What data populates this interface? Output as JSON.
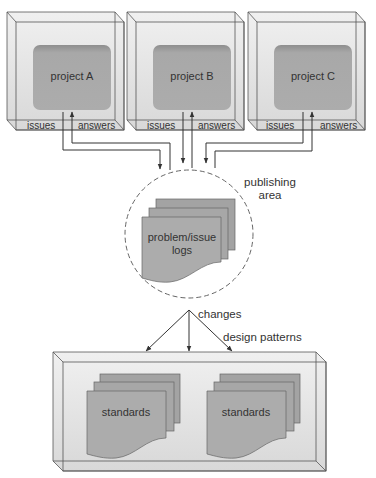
{
  "projects": [
    {
      "label": "project A",
      "issues_label": "issues",
      "answers_label": "answers"
    },
    {
      "label": "project B",
      "issues_label": "issues",
      "answers_label": "answers"
    },
    {
      "label": "project C",
      "issues_label": "issues",
      "answers_label": "answers"
    }
  ],
  "publishing": {
    "area_label_line1": "publishing",
    "area_label_line2": "area",
    "logs_label_line1": "problem/issue",
    "logs_label_line2": "logs"
  },
  "flows": {
    "changes_label": "changes",
    "design_patterns_label": "design patterns"
  },
  "standards": [
    {
      "label": "standards"
    },
    {
      "label": "standards"
    }
  ],
  "colors": {
    "box_fill": "#e6e6e6",
    "inner_fill": "#a9a9a9",
    "doc_fill": "#acacac",
    "line": "#555555",
    "text": "#333333"
  }
}
